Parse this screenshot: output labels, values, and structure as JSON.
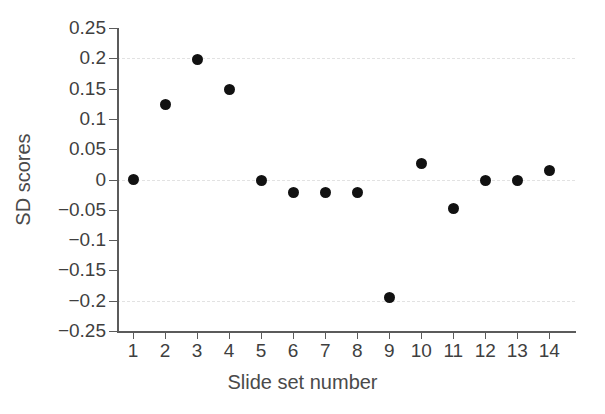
{
  "chart_data": {
    "type": "scatter",
    "title": "",
    "xlabel": "Slide set number",
    "ylabel": "SD scores",
    "x": [
      1,
      2,
      3,
      4,
      5,
      6,
      7,
      8,
      9,
      10,
      11,
      12,
      13,
      14
    ],
    "values": [
      0.0,
      0.123,
      0.198,
      0.148,
      -0.002,
      -0.022,
      -0.022,
      -0.022,
      -0.195,
      0.027,
      -0.048,
      -0.001,
      -0.001,
      0.015
    ],
    "categories": [
      "1",
      "2",
      "3",
      "4",
      "5",
      "6",
      "7",
      "8",
      "9",
      "10",
      "11",
      "12",
      "13",
      "14"
    ],
    "xlim": [
      0.5,
      14.8
    ],
    "ylim": [
      -0.25,
      0.25
    ],
    "ytick_labels": [
      "0.25",
      "0.2",
      "0.15",
      "0.1",
      "0.05",
      "0",
      "−0.05",
      "−0.1",
      "−0.15",
      "−0.2",
      "−0.25"
    ],
    "ytick_values": [
      0.25,
      0.2,
      0.15,
      0.1,
      0.05,
      0,
      -0.05,
      -0.1,
      -0.15,
      -0.2,
      -0.25
    ],
    "xtick_labels": [
      "1",
      "2",
      "3",
      "4",
      "5",
      "6",
      "7",
      "8",
      "9",
      "10",
      "11",
      "12",
      "13",
      "14"
    ],
    "gridlines_at": [
      0.2,
      0.0,
      -0.2
    ],
    "grid": true,
    "legend": "none",
    "marker_color": "#111111",
    "grid_color": "#e2e2e2",
    "axis_color": "#5b5b5b",
    "background_color": "#ffffff"
  }
}
